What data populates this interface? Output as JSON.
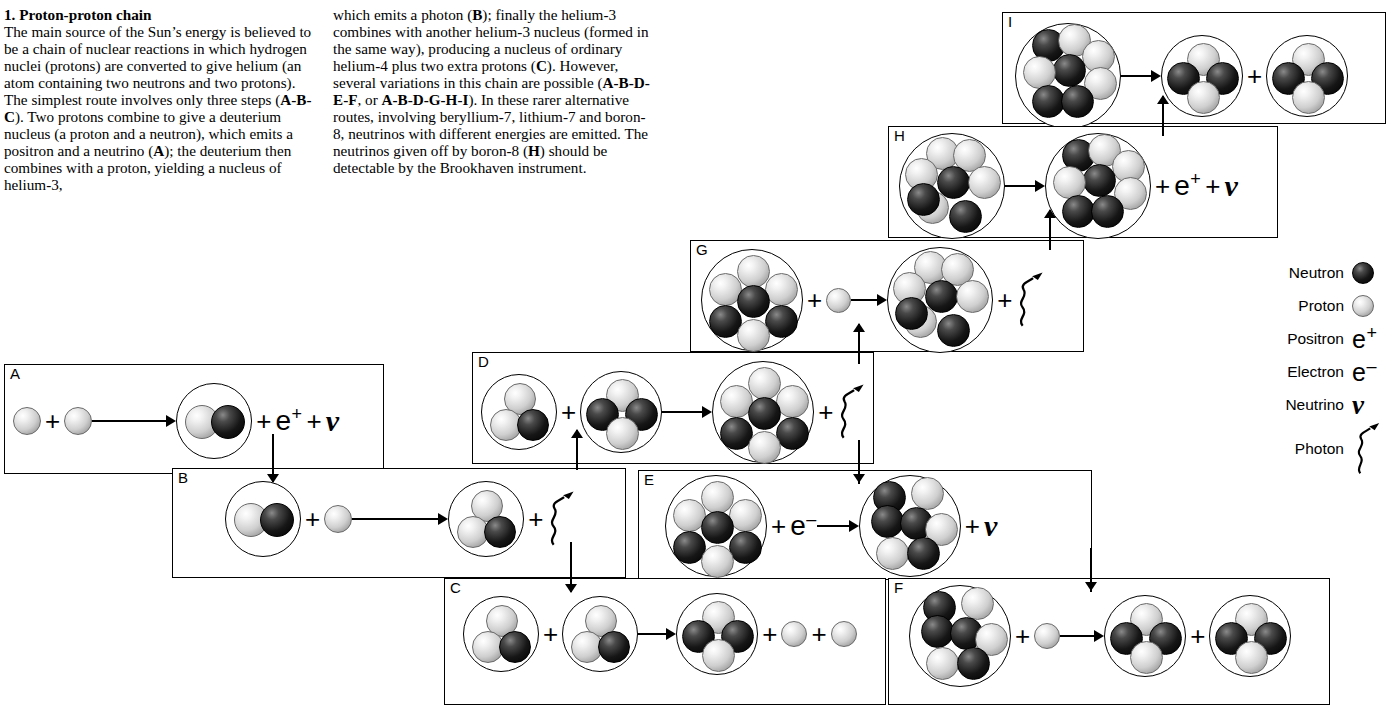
{
  "article": {
    "heading": "1. Proton-proton chain",
    "column1_html": "The main source of the Sun’s energy is believed to be a chain of nuclear reactions in which hydrogen nuclei (protons) are converted to give helium (an atom containing two neutrons and two protons). The simplest route involves only three steps (<b>A-B-C</b>). Two protons combine to give a deuterium nucleus (a proton and a neutron), which emits a positron and a neutrino (<b>A</b>); the deuterium then combines with a proton, yielding a nucleus of helium-3,",
    "column2_html": "which emits a photon (<b>B</b>); finally the helium-3 combines with another helium-3 nucleus (formed in the same way), producing a nucleus of ordinary helium-4 plus two extra protons (<b>C</b>). However, several variations in this chain are possible (<b>A-B-D-E-F</b>, or <b>A-B-D-G-H-I</b>). In these rarer alternative routes, involving beryllium-7, lithium-7 and boron-8, neutrinos with different energies are emitted. The neutrinos given off by boron-8 (<b>H</b>) should be detectable by the Brookhaven instrument."
  },
  "legend": {
    "title": "Particle key",
    "items": [
      {
        "label": "Neutron",
        "symbol": "neutron-ball",
        "glyph": ""
      },
      {
        "label": "Proton",
        "symbol": "proton-ball",
        "glyph": ""
      },
      {
        "label": "Positron",
        "symbol": "text",
        "glyph": "e+"
      },
      {
        "label": "Electron",
        "symbol": "text",
        "glyph": "e-"
      },
      {
        "label": "Neutrino",
        "symbol": "text",
        "glyph": "ν"
      },
      {
        "label": "Photon",
        "symbol": "squiggle-arrow",
        "glyph": ""
      }
    ]
  },
  "colors": {
    "ink": "#000000",
    "panel_border": "#000000",
    "proton_fill": "#cfcfcf",
    "neutron_fill": "#111111",
    "background": "#ffffff"
  },
  "panels": [
    {
      "id": "A",
      "label": "A",
      "equation": "p + p → deuterium (1p+1n) + e+ + ν",
      "reactants": [
        "proton",
        "proton"
      ],
      "products": [
        "deuterium",
        "positron",
        "neutrino"
      ],
      "extra_terms": [
        "e+",
        "ν"
      ]
    },
    {
      "id": "B",
      "label": "B",
      "equation": "deuterium (1p+1n) + p → helium-3 (2p+1n) + photon",
      "reactants": [
        "deuterium",
        "proton"
      ],
      "products": [
        "helium-3",
        "photon"
      ],
      "extra_terms": []
    },
    {
      "id": "C",
      "label": "C",
      "equation": "helium-3 + helium-3 → helium-4 (2p+2n) + p + p",
      "reactants": [
        "helium-3",
        "helium-3"
      ],
      "products": [
        "helium-4",
        "proton",
        "proton"
      ],
      "extra_terms": []
    },
    {
      "id": "D",
      "label": "D",
      "equation": "helium-3 + helium-4 → beryllium-7 (4p+3n) + photon",
      "reactants": [
        "helium-3",
        "helium-4"
      ],
      "products": [
        "beryllium-7",
        "photon"
      ],
      "extra_terms": []
    },
    {
      "id": "E",
      "label": "E",
      "equation": "beryllium-7 + e- → lithium-7 (3p+4n) + ν",
      "reactants": [
        "beryllium-7",
        "electron"
      ],
      "products": [
        "lithium-7",
        "neutrino"
      ],
      "extra_terms": [
        "e-",
        "ν"
      ]
    },
    {
      "id": "F",
      "label": "F",
      "equation": "lithium-7 + p → helium-4 + helium-4",
      "reactants": [
        "lithium-7",
        "proton"
      ],
      "products": [
        "helium-4",
        "helium-4"
      ],
      "extra_terms": []
    },
    {
      "id": "G",
      "label": "G",
      "equation": "beryllium-7 + p → boron-8 (5p+3n) + photon",
      "reactants": [
        "beryllium-7",
        "proton"
      ],
      "products": [
        "boron-8",
        "photon"
      ],
      "extra_terms": []
    },
    {
      "id": "H",
      "label": "H",
      "equation": "boron-8 → beryllium-8 (4p+4n) + e+ + ν",
      "reactants": [
        "boron-8"
      ],
      "products": [
        "beryllium-8",
        "positron",
        "neutrino"
      ],
      "extra_terms": [
        "e+",
        "ν"
      ]
    },
    {
      "id": "I",
      "label": "I",
      "equation": "beryllium-8 → helium-4 + helium-4",
      "reactants": [
        "beryllium-8"
      ],
      "products": [
        "helium-4",
        "helium-4"
      ],
      "extra_terms": []
    }
  ],
  "flow": {
    "description": "Panel-to-panel chain connectors",
    "links": [
      {
        "from": "A",
        "to": "B",
        "direction": "down"
      },
      {
        "from": "B",
        "to": "C",
        "direction": "down"
      },
      {
        "from": "B",
        "to": "D",
        "direction": "up"
      },
      {
        "from": "D",
        "to": "E",
        "direction": "down"
      },
      {
        "from": "E",
        "to": "F",
        "direction": "down"
      },
      {
        "from": "D",
        "to": "G",
        "direction": "up"
      },
      {
        "from": "G",
        "to": "H",
        "direction": "up"
      },
      {
        "from": "H",
        "to": "I",
        "direction": "up"
      }
    ]
  },
  "operators": {
    "plus": "+",
    "arrow": "→"
  }
}
